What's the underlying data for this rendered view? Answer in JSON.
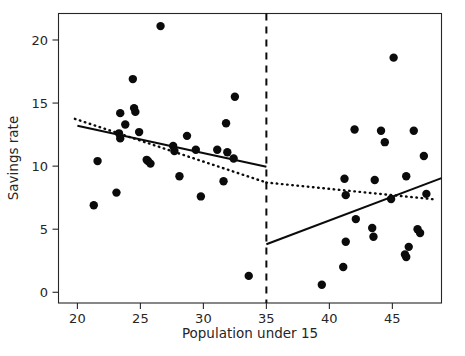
{
  "chart_data": {
    "type": "scatter",
    "title": "",
    "xlabel": "Population under 15",
    "ylabel": "Savings rate",
    "xlim": [
      18.5,
      48.9
    ],
    "ylim": [
      -0.85,
      22.1
    ],
    "xticks": [
      20,
      25,
      30,
      35,
      40,
      45
    ],
    "yticks": [
      0,
      5,
      10,
      15,
      20
    ],
    "xtick_labels": [
      "20",
      "25",
      "30",
      "35",
      "40",
      "45"
    ],
    "ytick_labels": [
      "0",
      "5",
      "10",
      "15",
      "20"
    ],
    "grid": false,
    "legend": null,
    "marker_color": "#0b0b0b",
    "line_color": "#0b0b0b",
    "cutoff": {
      "name": "cutoff-threshold",
      "x": 35,
      "style": "dashed",
      "label": ""
    },
    "points": [
      {
        "x": 21.3,
        "y": 6.9
      },
      {
        "x": 21.6,
        "y": 10.4
      },
      {
        "x": 23.1,
        "y": 7.9
      },
      {
        "x": 23.3,
        "y": 12.6
      },
      {
        "x": 23.4,
        "y": 12.2
      },
      {
        "x": 23.4,
        "y": 14.2
      },
      {
        "x": 23.8,
        "y": 13.3
      },
      {
        "x": 24.4,
        "y": 16.9
      },
      {
        "x": 24.5,
        "y": 14.6
      },
      {
        "x": 24.6,
        "y": 14.3
      },
      {
        "x": 24.9,
        "y": 12.7
      },
      {
        "x": 25.5,
        "y": 10.5
      },
      {
        "x": 25.6,
        "y": 10.4
      },
      {
        "x": 25.8,
        "y": 10.2
      },
      {
        "x": 26.6,
        "y": 21.1
      },
      {
        "x": 27.6,
        "y": 11.6
      },
      {
        "x": 27.7,
        "y": 11.2
      },
      {
        "x": 28.1,
        "y": 9.2
      },
      {
        "x": 28.7,
        "y": 12.4
      },
      {
        "x": 29.4,
        "y": 11.3
      },
      {
        "x": 29.8,
        "y": 7.6
      },
      {
        "x": 31.1,
        "y": 11.3
      },
      {
        "x": 31.6,
        "y": 8.8
      },
      {
        "x": 31.8,
        "y": 13.4
      },
      {
        "x": 31.9,
        "y": 11.1
      },
      {
        "x": 32.4,
        "y": 10.6
      },
      {
        "x": 32.5,
        "y": 15.5
      },
      {
        "x": 33.6,
        "y": 1.3
      },
      {
        "x": 39.4,
        "y": 0.6
      },
      {
        "x": 41.1,
        "y": 2.0
      },
      {
        "x": 41.2,
        "y": 9.0
      },
      {
        "x": 41.3,
        "y": 7.7
      },
      {
        "x": 41.3,
        "y": 4.0
      },
      {
        "x": 42.0,
        "y": 12.9
      },
      {
        "x": 42.1,
        "y": 5.8
      },
      {
        "x": 43.4,
        "y": 5.1
      },
      {
        "x": 43.5,
        "y": 4.4
      },
      {
        "x": 43.6,
        "y": 8.9
      },
      {
        "x": 44.1,
        "y": 12.8
      },
      {
        "x": 44.4,
        "y": 11.9
      },
      {
        "x": 44.9,
        "y": 7.4
      },
      {
        "x": 45.1,
        "y": 18.6
      },
      {
        "x": 46.0,
        "y": 3.0
      },
      {
        "x": 46.1,
        "y": 2.8
      },
      {
        "x": 46.1,
        "y": 9.2
      },
      {
        "x": 46.3,
        "y": 3.6
      },
      {
        "x": 46.7,
        "y": 12.8
      },
      {
        "x": 47.0,
        "y": 5.0
      },
      {
        "x": 47.2,
        "y": 4.7
      },
      {
        "x": 47.5,
        "y": 10.8
      },
      {
        "x": 47.7,
        "y": 7.8
      }
    ],
    "series": [
      {
        "name": "left-fit-solid",
        "style": "solid",
        "x": [
          20.0,
          35.0
        ],
        "y": [
          13.2,
          9.95
        ]
      },
      {
        "name": "right-fit-solid",
        "style": "solid",
        "x": [
          35.0,
          48.9
        ],
        "y": [
          3.8,
          9.05
        ]
      },
      {
        "name": "left-fit-dotted",
        "style": "dotted",
        "x": [
          19.8,
          35.0
        ],
        "y": [
          13.75,
          8.7
        ]
      },
      {
        "name": "right-fit-dotted",
        "style": "dotted",
        "x": [
          35.0,
          48.5
        ],
        "y": [
          8.7,
          7.35
        ]
      }
    ]
  }
}
